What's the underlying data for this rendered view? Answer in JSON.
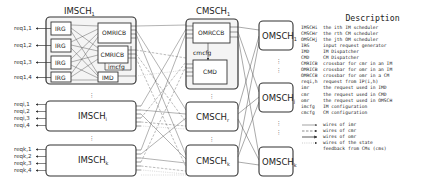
{
  "imsch_group": {
    "title": "IMSCH",
    "title_sub": "1",
    "blocks": {
      "irg": [
        "IRG",
        "IRG",
        "IRG",
        "IRG"
      ],
      "omricb": "OMRICB",
      "cmricb": "CMRICB",
      "imcfg": "imcfg",
      "imd": "IMD"
    },
    "requests": [
      "req1,1",
      "req1,2",
      "req1,3",
      "req1,4"
    ]
  },
  "imsch_i": {
    "label": "IMSCH",
    "label_sub": "i",
    "requests": [
      "reqi,1",
      "reqi,2",
      "reqi,3",
      "reqi,4"
    ]
  },
  "imsch_k": {
    "label": "IMSCH",
    "label_sub": "k",
    "requests": [
      "reqk,1",
      "reqk,2",
      "reqk,3",
      "reqk,4"
    ]
  },
  "cmsch_group": {
    "title": "CMSCH",
    "title_sub": "1",
    "blocks": {
      "omrccb": "OMRCCB",
      "cmcfg": "cmcfg",
      "cmd": "CMD"
    }
  },
  "cmsch_r": {
    "label": "CMSCH",
    "label_sub": "r"
  },
  "cmsch_k": {
    "label": "CMSCH",
    "label_sub": "k"
  },
  "omsch": [
    {
      "label": "OMSCH",
      "sub": "1"
    },
    {
      "label": "OMSCH",
      "sub": "j"
    },
    {
      "label": "OMSCH",
      "sub": "k"
    }
  ],
  "ellipsis": "⋮",
  "legend": {
    "title": "Description",
    "rows": [
      {
        "key": "IMSCHi",
        "desc": "the ith IM scheduler"
      },
      {
        "key": "CMSCHr",
        "desc": "the rth CM scheduler"
      },
      {
        "key": "OMSCHj",
        "desc": "the jth OM scheduler"
      },
      {
        "key": "IRG",
        "desc": "input request generator"
      },
      {
        "key": "IMD",
        "desc": "IM Dispatcher"
      },
      {
        "key": "CMD",
        "desc": "CM Dispatcher"
      },
      {
        "key": "CMRICB",
        "desc": "crossbar for cmr in an IM"
      },
      {
        "key": "OMRICB",
        "desc": "crossbar for omr in an IM"
      },
      {
        "key": "OMRCCB",
        "desc": "crossbar for omr in a CM"
      },
      {
        "key": "reqi,h",
        "desc": "request from IP(i,h)"
      },
      {
        "key": "imr",
        "desc": "the request used in IMD"
      },
      {
        "key": "cmr",
        "desc": "the request used in CMD"
      },
      {
        "key": "omr",
        "desc": "the request used in OMSCH"
      },
      {
        "key": "imcfg",
        "desc": "IM configuration"
      },
      {
        "key": "cmcfg",
        "desc": "CM configuration"
      }
    ],
    "wires": [
      {
        "style": "thin-solid",
        "desc": "wires of imr"
      },
      {
        "style": "dashed",
        "desc": "wires of cmr"
      },
      {
        "style": "solid",
        "desc": "wires of omr"
      },
      {
        "style": "dotted",
        "desc": "wires of the state"
      },
      {
        "style": "none",
        "desc": "feedback from CMs (cms)"
      }
    ]
  },
  "colors": {
    "stroke": "#333333",
    "box_fill": "#ffffff",
    "group_fill": "#f2f2f2",
    "wire": "#555555",
    "wire_light": "#999999"
  }
}
